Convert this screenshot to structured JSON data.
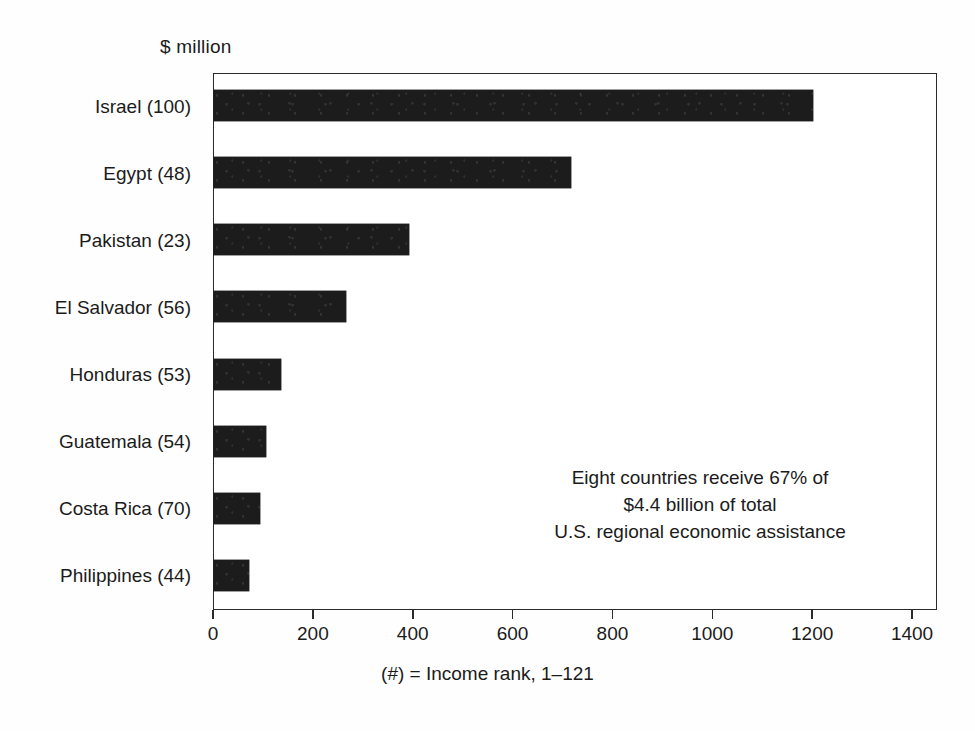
{
  "chart_data": {
    "type": "bar",
    "orientation": "horizontal",
    "title": "",
    "unit_label": "$ million",
    "xlabel": "",
    "ylabel": "",
    "xlim": [
      0,
      1450
    ],
    "grid": false,
    "legend": false,
    "bar_color": "#1c1c1c",
    "frame_color": "#2b2b2b",
    "categories": [
      "Israel (100)",
      "Egypt (48)",
      "Pakistan (23)",
      "El Salvador (56)",
      "Honduras (53)",
      "Guatemala (54)",
      "Costa Rica (70)",
      "Philippines (44)"
    ],
    "values": [
      1200,
      715,
      390,
      265,
      135,
      105,
      93,
      70
    ],
    "country_names": [
      "Israel",
      "Egypt",
      "Pakistan",
      "El Salvador",
      "Honduras",
      "Guatemala",
      "Costa Rica",
      "Philippines"
    ],
    "income_ranks": [
      100,
      48,
      23,
      56,
      53,
      54,
      70,
      44
    ],
    "xticks": [
      0,
      200,
      400,
      600,
      800,
      1000,
      1200,
      1400
    ],
    "xticklabels": [
      "0",
      "200",
      "400",
      "600",
      "800",
      "1000",
      "1200",
      "1400"
    ],
    "annotation_lines": [
      "Eight countries receive 67% of",
      "$4.4 billion of total",
      "U.S. regional economic assistance"
    ],
    "footnote": "(#) = Income rank, 1–121"
  }
}
